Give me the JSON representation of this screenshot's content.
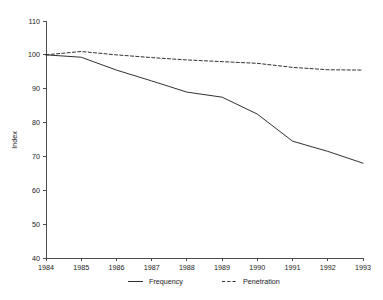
{
  "chart_data": {
    "type": "line",
    "title": "",
    "subtitle": "",
    "xlabel": "",
    "ylabel": "Index",
    "x": [
      1984,
      1985,
      1986,
      1987,
      1988,
      1989,
      1990,
      1991,
      1992,
      1993
    ],
    "xtick_labels": [
      "1984",
      "1985",
      "1986",
      "1987",
      "1988",
      "1989",
      "1990",
      "1991",
      "1992",
      "1993"
    ],
    "ytick_labels": [
      "40",
      "50",
      "60",
      "70",
      "80",
      "90",
      "100",
      "110"
    ],
    "yticks": [
      40,
      50,
      60,
      70,
      80,
      90,
      100,
      110
    ],
    "xlim": [
      1984,
      1993
    ],
    "ylim": [
      40,
      110
    ],
    "grid": false,
    "legend_position": "bottom-center",
    "series": [
      {
        "name": "Frequency",
        "style": "solid",
        "color": "#262626",
        "values": [
          100,
          99.3,
          95.5,
          92.3,
          89.0,
          87.5,
          82.5,
          74.5,
          71.5,
          68.0
        ]
      },
      {
        "name": "Penetration",
        "style": "dashed",
        "color": "#262626",
        "values": [
          100,
          101.0,
          100.0,
          99.2,
          98.5,
          98.0,
          97.5,
          96.3,
          95.6,
          95.5
        ]
      }
    ],
    "legend": [
      {
        "label": "Frequency",
        "style": "solid"
      },
      {
        "label": "Penetration",
        "style": "dashed"
      }
    ]
  }
}
